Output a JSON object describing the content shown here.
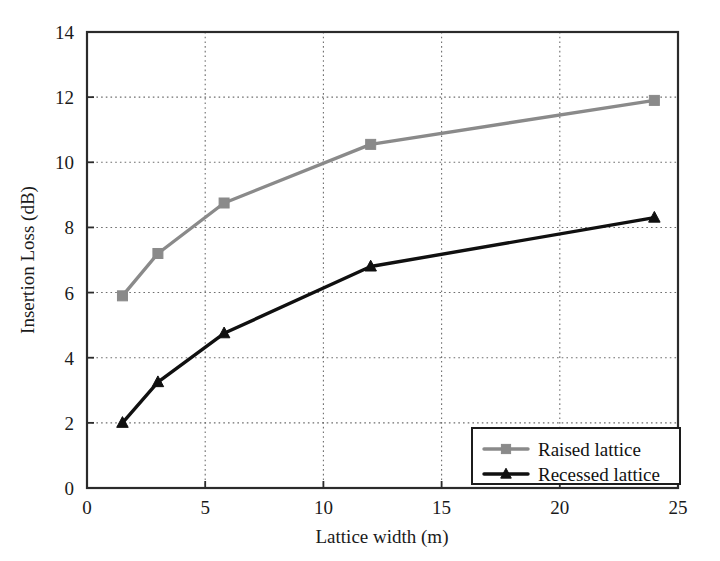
{
  "chart_data": {
    "type": "line",
    "title": "",
    "xlabel": "Lattice width (m)",
    "ylabel": "Insertion Loss (dB)",
    "xlim": [
      0,
      25
    ],
    "ylim": [
      0,
      14
    ],
    "xticks": [
      0,
      5,
      10,
      15,
      20,
      25
    ],
    "yticks": [
      0,
      2,
      4,
      6,
      8,
      10,
      12,
      14
    ],
    "xtick_labels": [
      "0",
      "5",
      "10",
      "15",
      "20",
      "25"
    ],
    "ytick_labels": [
      "0",
      "2",
      "4",
      "6",
      "8",
      "10",
      "12",
      "14"
    ],
    "grid": true,
    "grid_style": "dotted",
    "legend_position": "lower-right",
    "x": [
      1.5,
      3.0,
      5.8,
      12.0,
      24.0
    ],
    "series": [
      {
        "name": "Raised lattice",
        "values": [
          5.9,
          7.2,
          8.75,
          10.55,
          11.9
        ],
        "color": "#8a8a8a",
        "marker": "square"
      },
      {
        "name": "Recessed lattice",
        "values": [
          2.0,
          3.25,
          4.75,
          6.8,
          8.3
        ],
        "color": "#101010",
        "marker": "triangle"
      }
    ]
  },
  "legend": {
    "entries": [
      {
        "label": "Raised lattice"
      },
      {
        "label": "Recessed lattice"
      }
    ]
  },
  "axes": {
    "x_title": "Lattice width (m)",
    "y_title": "Insertion Loss (dB)"
  }
}
